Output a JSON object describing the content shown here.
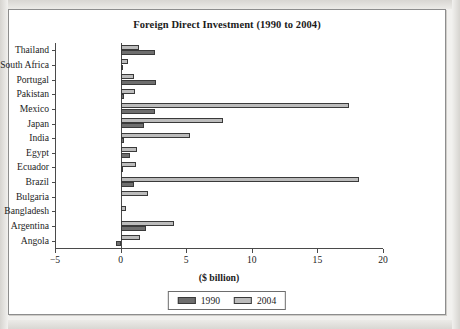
{
  "chart_data": {
    "type": "bar",
    "orientation": "horizontal",
    "title": "Foreign Direct Investment (1990 to 2004)",
    "xlabel": "($ billion)",
    "ylabel": "",
    "xlim": [
      -5,
      20
    ],
    "xticks": [
      -5,
      0,
      5,
      10,
      15,
      20
    ],
    "xtick_labels": [
      "−5",
      "0",
      "5",
      "10",
      "15",
      "20"
    ],
    "grid": false,
    "legend_position": "bottom",
    "categories": [
      "Thailand",
      "South Africa",
      "Portugal",
      "Pakistan",
      "Mexico",
      "Japan",
      "India",
      "Egypt",
      "Ecuador",
      "Brazil",
      "Bulgaria",
      "Bangladesh",
      "Argentina",
      "Angola"
    ],
    "series": [
      {
        "name": "1990",
        "color": "#6e6e6e",
        "values": [
          2.6,
          0.08,
          2.7,
          0.25,
          2.6,
          1.8,
          0.24,
          0.75,
          0.12,
          1.0,
          0.0,
          0.0,
          1.9,
          -0.33
        ]
      },
      {
        "name": "2004",
        "color": "#bcbcbc",
        "values": [
          1.4,
          0.6,
          1.0,
          1.1,
          17.4,
          7.8,
          5.3,
          1.25,
          1.2,
          18.2,
          2.1,
          0.45,
          4.1,
          1.45
        ]
      }
    ]
  },
  "legend": {
    "items": [
      {
        "label": "1990"
      },
      {
        "label": "2004"
      }
    ]
  },
  "colors": {
    "series_1990": "#6e6e6e",
    "series_2004": "#bcbcbc",
    "axis": "#4a4a4a",
    "frame": "#8d8d8d",
    "text": "#1c1c1c"
  }
}
